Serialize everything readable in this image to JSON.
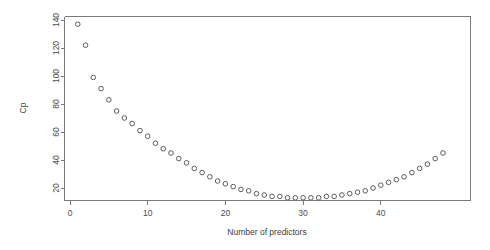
{
  "chart_data": {
    "type": "scatter",
    "title": "",
    "xlabel": "Number of predictors",
    "ylabel": "Cp",
    "xlim": [
      0,
      49
    ],
    "ylim": [
      8,
      145
    ],
    "grid": false,
    "legend": null,
    "xticks": [
      0,
      10,
      20,
      30,
      40
    ],
    "yticks": [
      20,
      40,
      60,
      80,
      100,
      120,
      140
    ],
    "xtick_labels": [
      "0",
      "10",
      "20",
      "30",
      "40"
    ],
    "ytick_labels": [
      "20",
      "40",
      "60",
      "80",
      "100",
      "120",
      "140"
    ],
    "point_style": {
      "marker": "open-circle",
      "radius": 2.3,
      "stroke": "#5c5c5c",
      "fill": "none"
    },
    "x": [
      1,
      2,
      3,
      4,
      5,
      6,
      7,
      8,
      9,
      10,
      11,
      12,
      13,
      14,
      15,
      16,
      17,
      18,
      19,
      20,
      21,
      22,
      23,
      24,
      25,
      26,
      27,
      28,
      29,
      30,
      31,
      32,
      33,
      34,
      35,
      36,
      37,
      38,
      39,
      40,
      41,
      42,
      43,
      44,
      45,
      46,
      47,
      48
    ],
    "y": [
      137,
      122,
      99,
      91,
      83,
      75,
      70,
      66,
      61,
      57,
      52,
      48,
      45,
      41,
      38,
      34,
      31,
      28,
      25,
      23,
      21,
      19,
      18,
      16,
      15,
      14,
      14,
      13,
      13,
      13,
      13,
      13,
      14,
      14,
      15,
      16,
      17,
      18,
      20,
      22,
      24,
      26,
      28,
      31,
      34,
      37,
      41,
      45
    ],
    "series": [
      {
        "name": "Cp",
        "x": [
          1,
          2,
          3,
          4,
          5,
          6,
          7,
          8,
          9,
          10,
          11,
          12,
          13,
          14,
          15,
          16,
          17,
          18,
          19,
          20,
          21,
          22,
          23,
          24,
          25,
          26,
          27,
          28,
          29,
          30,
          31,
          32,
          33,
          34,
          35,
          36,
          37,
          38,
          39,
          40,
          41,
          42,
          43,
          44,
          45,
          46,
          47,
          48
        ],
        "values": [
          137,
          122,
          99,
          91,
          83,
          75,
          70,
          66,
          61,
          57,
          52,
          48,
          45,
          41,
          38,
          34,
          31,
          28,
          25,
          23,
          21,
          19,
          18,
          16,
          15,
          14,
          14,
          13,
          13,
          13,
          13,
          13,
          14,
          14,
          15,
          16,
          17,
          18,
          20,
          22,
          24,
          26,
          28,
          31,
          34,
          37,
          41,
          45
        ]
      }
    ]
  },
  "colors": {
    "axis": "#7a7a7a",
    "point": "#5c5c5c",
    "text": "#3c3c3c",
    "background": "#ffffff"
  }
}
